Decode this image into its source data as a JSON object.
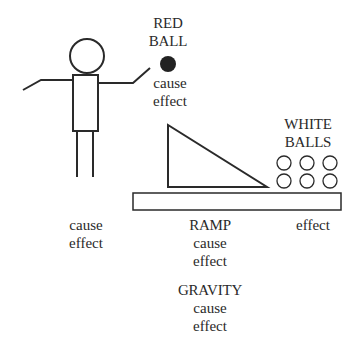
{
  "diagram": {
    "person": {
      "label_cause": "cause",
      "label_effect": "effect"
    },
    "red_ball": {
      "name_line1": "RED",
      "name_line2": "BALL",
      "label_cause": "cause",
      "label_effect": "effect",
      "fill": "#222222"
    },
    "ramp": {
      "name": "RAMP",
      "label_cause": "cause",
      "label_effect": "effect"
    },
    "gravity": {
      "name": "GRAVITY",
      "label_cause": "cause",
      "label_effect": "effect"
    },
    "white_balls": {
      "name_line1": "WHITE",
      "name_line2": "BALLS",
      "label_effect": "effect",
      "count": 6
    },
    "colors": {
      "stroke": "#2a2a2a",
      "background": "#ffffff"
    }
  }
}
